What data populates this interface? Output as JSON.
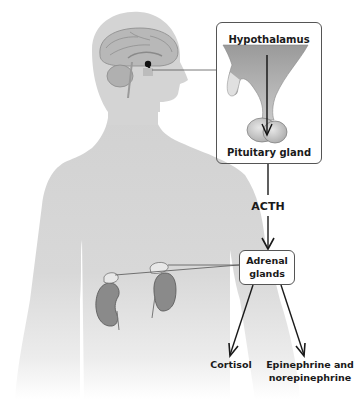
{
  "diagram": {
    "type": "hormone-pathway",
    "nodes": {
      "hypothalamus": {
        "label": "Hypothalamus"
      },
      "pituitary": {
        "label": "Pituitary gland"
      },
      "hormone": {
        "label": "ACTH"
      },
      "adrenal": {
        "label_line1": "Adrenal",
        "label_line2": "glands"
      },
      "cortisol": {
        "label": "Cortisol"
      },
      "epinephrine": {
        "label_line1": "Epinephrine and",
        "label_line2": "norepinephrine"
      }
    },
    "edges": [
      {
        "from": "hypothalamus",
        "to": "pituitary"
      },
      {
        "from": "pituitary",
        "to": "adrenal",
        "label": "ACTH"
      },
      {
        "from": "adrenal",
        "to": "cortisol"
      },
      {
        "from": "adrenal",
        "to": "epinephrine"
      }
    ],
    "colors": {
      "body": "#d4d4d4",
      "kidney": "#8a8a8a",
      "adrenal_cap": "#e8e8e8",
      "line": "#1a1a1a",
      "connector": "#555555"
    }
  }
}
